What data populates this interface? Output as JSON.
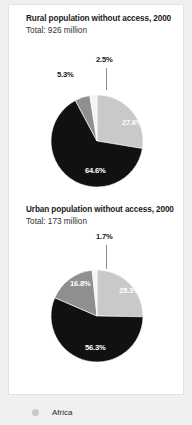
{
  "theme": {
    "page_background": "#f0f0f0",
    "card_background": "#ffffff",
    "card_border": "#e2e2e2",
    "title_color": "#1a1a1a",
    "label_inside_color": "#ffffff",
    "label_outside_color": "#1a1a1a",
    "leader_line_color": "#8a8a8a"
  },
  "legend": {
    "marker_name": "africa-legend-dot",
    "marker_color": "#c9c9c9",
    "label": "Africa"
  },
  "chart_data": [
    {
      "type": "pie",
      "title": "Rural population without access, 2000",
      "subtitle": "Total: 926 million",
      "total_value": 926,
      "total_units": "million",
      "xlabel": "",
      "ylabel": "",
      "legend_position": "bottom",
      "grid": false,
      "categories": [
        "Asia",
        "Africa",
        "Latin America and the Caribbean",
        "Other"
      ],
      "values": [
        27.6,
        64.6,
        5.3,
        2.5
      ],
      "labels": [
        "27.6%",
        "64.6%",
        "5.3%",
        "2.5%"
      ],
      "colors": [
        "#c9c9c9",
        "#111111",
        "#8f8f8f",
        "#f4f4f4"
      ],
      "slices": [
        {
          "label": "27.6%",
          "value": 27.6,
          "color": "#c9c9c9",
          "label_placement": "inside"
        },
        {
          "label": "64.6%",
          "value": 64.6,
          "color": "#111111",
          "label_placement": "inside"
        },
        {
          "label": "5.3%",
          "value": 5.3,
          "color": "#8f8f8f",
          "label_placement": "outside"
        },
        {
          "label": "2.5%",
          "value": 2.5,
          "color": "#f4f4f4",
          "label_placement": "outside"
        }
      ]
    },
    {
      "type": "pie",
      "title": "Urban population without access, 2000",
      "subtitle": "Total: 173 million",
      "total_value": 173,
      "total_units": "million",
      "xlabel": "",
      "ylabel": "",
      "legend_position": "bottom",
      "grid": false,
      "categories": [
        "Asia",
        "Africa",
        "Latin America and the Caribbean",
        "Other"
      ],
      "values": [
        25.3,
        56.3,
        16.8,
        1.7
      ],
      "labels": [
        "25.3%",
        "56.3%",
        "16.8%",
        "1.7%"
      ],
      "colors": [
        "#c9c9c9",
        "#111111",
        "#8f8f8f",
        "#f4f4f4"
      ],
      "slices": [
        {
          "label": "25.3%",
          "value": 25.3,
          "color": "#c9c9c9",
          "label_placement": "inside"
        },
        {
          "label": "56.3%",
          "value": 56.3,
          "color": "#111111",
          "label_placement": "inside"
        },
        {
          "label": "16.8%",
          "value": 16.8,
          "color": "#8f8f8f",
          "label_placement": "inside"
        },
        {
          "label": "1.7%",
          "value": 1.7,
          "color": "#f4f4f4",
          "label_placement": "outside"
        }
      ]
    }
  ]
}
